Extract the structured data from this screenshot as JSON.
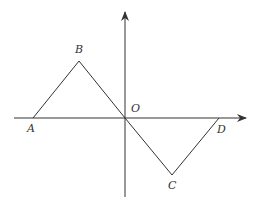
{
  "diagram": {
    "type": "coordinate-graph",
    "colors": {
      "line": "#333333",
      "background": "#ffffff"
    },
    "axes": {
      "x_axis": {
        "from": [
          14,
          118
        ],
        "to": [
          246,
          118
        ],
        "arrow": true
      },
      "y_axis": {
        "from": [
          125,
          197
        ],
        "to": [
          125,
          12
        ],
        "arrow": true
      }
    },
    "points": [
      {
        "name": "A",
        "label": "A",
        "pos": [
          33,
          118
        ],
        "label_pos": [
          27,
          132
        ]
      },
      {
        "name": "B",
        "label": "B",
        "pos": [
          79,
          61
        ],
        "label_pos": [
          75,
          53
        ]
      },
      {
        "name": "O",
        "label": "O",
        "pos": [
          125,
          118
        ],
        "label_pos": [
          131,
          112
        ]
      },
      {
        "name": "C",
        "label": "C",
        "pos": [
          172,
          175
        ],
        "label_pos": [
          168,
          189
        ]
      },
      {
        "name": "D",
        "label": "D",
        "pos": [
          219,
          118
        ],
        "label_pos": [
          217,
          133
        ]
      }
    ],
    "polyline": [
      "A",
      "B",
      "O",
      "C",
      "D"
    ]
  }
}
